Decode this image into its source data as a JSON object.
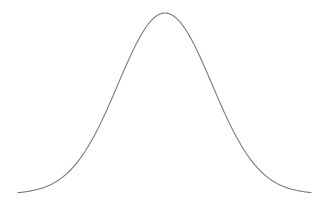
{
  "chart_data": {
    "type": "line",
    "title": "",
    "xlabel": "",
    "ylabel": "",
    "grid": false,
    "legend": null,
    "series": [
      {
        "name": "normal-density",
        "distribution": "gaussian",
        "mean": 0,
        "std": 1,
        "x_range": [
          -3.1,
          3.1
        ],
        "color": "#7a7a7a"
      }
    ],
    "pixel_geometry": {
      "x_start": 18,
      "x_end": 311,
      "peak_x": 165,
      "peak_y": 13,
      "baseline_y": 194,
      "sigma_px": 47
    }
  }
}
